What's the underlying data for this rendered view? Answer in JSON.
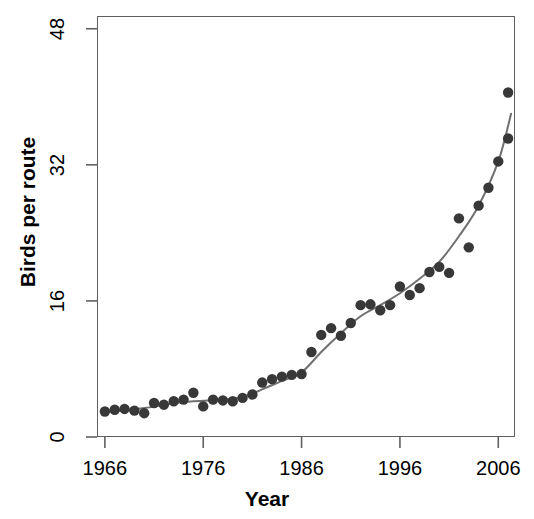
{
  "chart_data": {
    "type": "scatter",
    "title": "",
    "subtitle": "",
    "xlabel": "Year",
    "ylabel": "Birds per route",
    "xlim": [
      1965.2,
      2007.7
    ],
    "ylim": [
      0,
      49.5
    ],
    "xticks": [
      1966,
      1976,
      1986,
      1996,
      2006
    ],
    "xtick_labels": [
      "1966",
      "1976",
      "1986",
      "1996",
      "2006"
    ],
    "yticks": [
      0,
      16,
      32,
      48
    ],
    "ytick_labels": [
      "0",
      "16",
      "32",
      "48"
    ],
    "grid": false,
    "legend": null,
    "point_color": "#383838",
    "line_color": "#707070",
    "frame_color": "#606060",
    "background": "#ffffff",
    "point_radius": 5.2,
    "series": [
      {
        "name": "Birds per route",
        "kind": "points",
        "x": [
          1966,
          1967,
          1968,
          1969,
          1970,
          1971,
          1972,
          1973,
          1974,
          1975,
          1976,
          1977,
          1978,
          1979,
          1980,
          1981,
          1982,
          1983,
          1984,
          1985,
          1986,
          1987,
          1988,
          1989,
          1990,
          1991,
          1992,
          1993,
          1994,
          1995,
          1996,
          1997,
          1998,
          1999,
          2000,
          2001,
          2002,
          2003,
          2004,
          2005,
          2006,
          2007
        ],
        "y": [
          3.0,
          3.2,
          3.3,
          3.1,
          2.8,
          4.0,
          3.8,
          4.2,
          4.4,
          5.2,
          3.6,
          4.4,
          4.3,
          4.2,
          4.6,
          5.0,
          6.4,
          6.8,
          7.1,
          7.3,
          7.4,
          10.0,
          12.0,
          12.8,
          11.9,
          13.4,
          15.5,
          15.6,
          14.9,
          15.5,
          17.7,
          16.7,
          17.5,
          19.4,
          20.0,
          19.3,
          25.7,
          22.3,
          27.2,
          29.3,
          32.4,
          35.1
        ]
      },
      {
        "name": "smooth fit",
        "kind": "line",
        "x": [
          1966,
          1970,
          1974,
          1978,
          1980,
          1982,
          1984,
          1986,
          1988,
          1990,
          1992,
          1994,
          1996,
          1998,
          2000,
          2002,
          2004,
          2006,
          2007.3
        ],
        "y": [
          2.9,
          3.4,
          4.1,
          4.4,
          4.7,
          5.6,
          6.6,
          7.6,
          10.0,
          12.2,
          14.2,
          15.5,
          16.9,
          18.6,
          20.6,
          23.6,
          27.2,
          32.4,
          38.0
        ]
      }
    ],
    "last_point": {
      "x": 2007,
      "y": 40.5
    }
  },
  "axes": {
    "y_title": "Birds per route",
    "x_title": "Year"
  }
}
